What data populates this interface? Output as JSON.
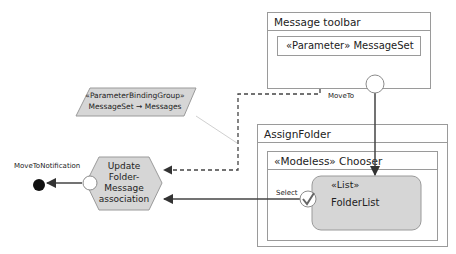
{
  "diagram": {
    "message_toolbar": {
      "title": "Message toolbar",
      "parameter": "«Parameter» MessageSet"
    },
    "assign_folder": {
      "title": "AssignFolder",
      "chooser": {
        "title": "«Modeless» Chooser",
        "list": {
          "stereotype": "«List»",
          "name": "FolderList"
        },
        "select_label": "Select"
      }
    },
    "binding_group": {
      "stereotype": "«ParameterBindingGroup»",
      "binding": "MessageSet → Messages"
    },
    "action": {
      "lines": [
        "Update",
        "Folder-",
        "Message",
        "association"
      ]
    },
    "edges": {
      "move_to_label": "MoveTo",
      "notification_label": "MoveToNotification"
    },
    "colors": {
      "fill_gray": "#d9d9d9",
      "stroke": "#8c8c8c",
      "edge": "#444444",
      "final_node": "#111111"
    }
  }
}
